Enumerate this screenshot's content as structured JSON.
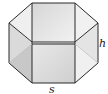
{
  "figure": {
    "type": "hexagonal-prism",
    "labels": {
      "height": "h",
      "side": "s"
    },
    "colors": {
      "edge": "#2a2a2a",
      "front_face": "#d9d9d9",
      "side_face_light": "#ececec",
      "side_face_dark": "#c4c4c4",
      "top_face": "#e6e6e6"
    }
  }
}
